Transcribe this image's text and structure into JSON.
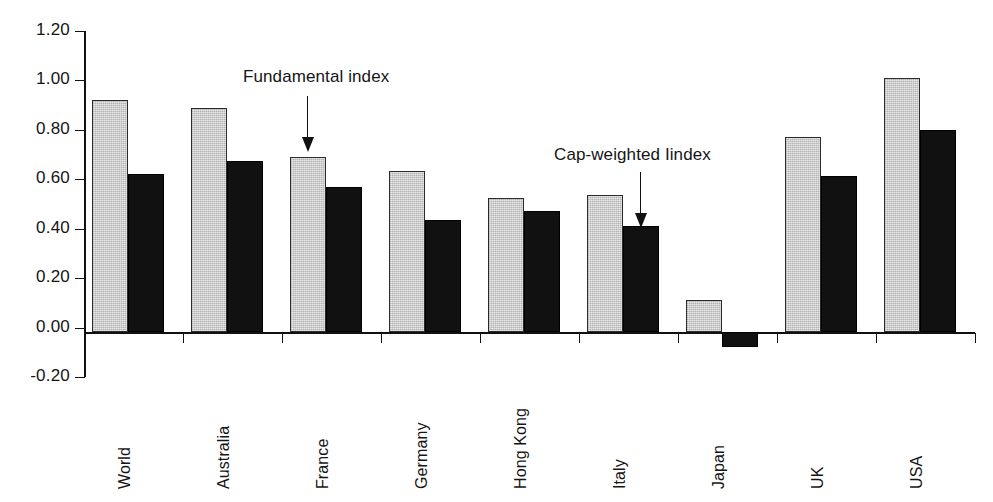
{
  "chart_data": {
    "type": "bar",
    "title": "",
    "subtitle": "",
    "xlabel": "",
    "ylabel": "",
    "ylim": [
      -0.2,
      1.2
    ],
    "ytick_labels": [
      "1.20",
      "1.00",
      "0.80",
      "0.60",
      "0.40",
      "0.20",
      "0.00",
      "-0.20"
    ],
    "ytick_values": [
      1.2,
      1.0,
      0.8,
      0.6,
      0.4,
      0.2,
      0.0,
      -0.2
    ],
    "grid": false,
    "legend_position": "none",
    "categories": [
      "World",
      "Australia",
      "France",
      "Germany",
      "Hong Kong",
      "Italy",
      "Japan",
      "UK",
      "USA"
    ],
    "series": [
      {
        "name": "Fundamental index",
        "color": "#c9c9c9",
        "values": [
          0.92,
          0.89,
          0.69,
          0.635,
          0.525,
          0.535,
          0.11,
          0.77,
          1.01
        ]
      },
      {
        "name": "Cap-weighted Iindex",
        "color": "#111111",
        "values": [
          0.62,
          0.675,
          0.57,
          0.435,
          0.47,
          0.41,
          -0.08,
          0.615,
          0.8
        ]
      }
    ],
    "annotations": [
      {
        "text": "Fundamental index",
        "target_category": "France",
        "target_series": "Fundamental index"
      },
      {
        "text": "Cap-weighted Iindex",
        "target_category": "Italy",
        "target_series": "Cap-weighted Iindex"
      }
    ]
  },
  "colors": {
    "axis": "#111111",
    "fundamental_fill": "#c9c9c9",
    "cap_weighted_fill": "#111111",
    "text": "#151515",
    "background": "#ffffff"
  }
}
